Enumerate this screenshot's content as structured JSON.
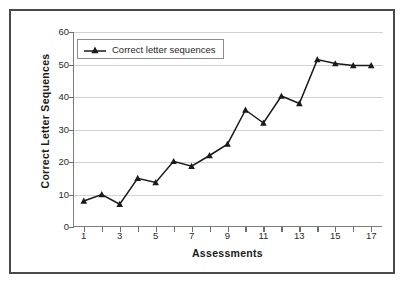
{
  "chart_data": {
    "type": "line",
    "title": "",
    "xlabel": "Assessments",
    "ylabel": "Correct Letter Sequences",
    "xlim": [
      0.4,
      17.6
    ],
    "ylim": [
      0,
      60
    ],
    "yticks": [
      0,
      10,
      20,
      30,
      40,
      50,
      60
    ],
    "xticks": [
      1,
      2,
      3,
      4,
      5,
      6,
      7,
      8,
      9,
      10,
      11,
      12,
      13,
      14,
      15,
      16,
      17
    ],
    "xtick_labels": [
      "1",
      "",
      "3",
      "",
      "5",
      "",
      "7",
      "",
      "9",
      "",
      "11",
      "",
      "13",
      "",
      "15",
      "",
      "17"
    ],
    "grid": "horizontal",
    "legend_position": "upper-left-inside",
    "marker": "triangle",
    "line_color": "#1a1a1a",
    "series": [
      {
        "name": "Correct letter sequences",
        "x": [
          1,
          2,
          3,
          4,
          5,
          6,
          7,
          8,
          9,
          10,
          11,
          12,
          13,
          14,
          15,
          16,
          17
        ],
        "values": [
          8,
          10,
          7,
          15,
          13.7,
          20.2,
          18.7,
          22,
          25.5,
          36,
          32,
          40.3,
          38,
          51.5,
          50.3,
          49.7,
          49.7
        ]
      }
    ]
  },
  "axes": {
    "y_title": "Correct Letter Sequences",
    "x_title": "Assessments"
  },
  "legend": {
    "entries": [
      {
        "label": "Correct letter sequences",
        "marker": "triangle-line-marker"
      }
    ]
  }
}
